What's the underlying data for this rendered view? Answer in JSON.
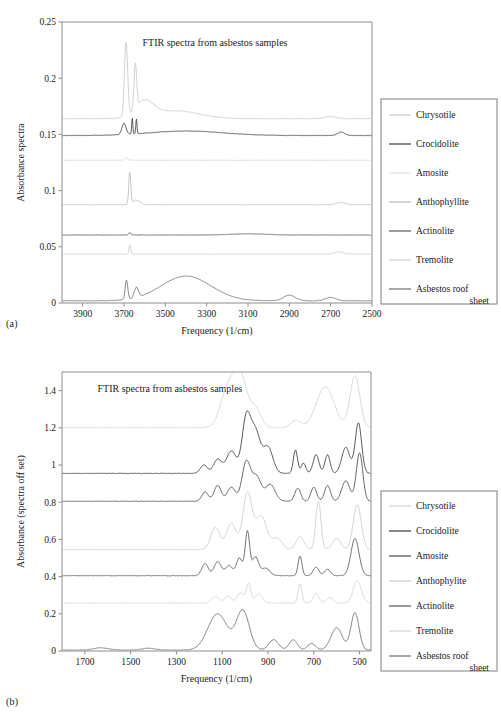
{
  "figure": {
    "panels": [
      {
        "id": "a",
        "label": "(a)",
        "title": "FTIR spectra from asbestos samples"
      },
      {
        "id": "b",
        "label": "(b)",
        "title": "FTIR spectra from asbestos samples"
      }
    ]
  },
  "chart_data": [
    {
      "type": "line",
      "panel": "a",
      "title": "FTIR spectra from asbestos samples",
      "xlabel": "Frequency (1/cm)",
      "ylabel": "Absorbance spectra",
      "xlim": [
        4000,
        2500
      ],
      "ylim": [
        0,
        0.25
      ],
      "xticks": [
        3900,
        3700,
        3500,
        3300,
        3100,
        2900,
        2700,
        2500
      ],
      "yticks": [
        0,
        0.05,
        0.1,
        0.15,
        0.2,
        0.25
      ],
      "x_inverted": true,
      "grid": false,
      "legend_position": "right",
      "series": [
        {
          "name": "Chrysotile",
          "color": "#c9c9c9",
          "baseline": 0.164,
          "peaks": [
            {
              "x": 3690,
              "height": 0.066,
              "width": 11
            },
            {
              "x": 3645,
              "height": 0.04,
              "width": 9
            },
            {
              "x": 3600,
              "height": 0.014,
              "width": 60
            },
            {
              "x": 3450,
              "height": 0.007,
              "width": 160
            },
            {
              "x": 2700,
              "height": 0.002,
              "width": 40
            }
          ]
        },
        {
          "name": "Crocidolite",
          "color": "#3d3d3d",
          "baseline": 0.149,
          "peaks": [
            {
              "x": 3700,
              "height": 0.01,
              "width": 14
            },
            {
              "x": 3660,
              "height": 0.014,
              "width": 4
            },
            {
              "x": 3640,
              "height": 0.013,
              "width": 4
            },
            {
              "x": 3400,
              "height": 0.004,
              "width": 250
            },
            {
              "x": 2650,
              "height": 0.003,
              "width": 25
            }
          ]
        },
        {
          "name": "Amosite",
          "color": "#d8d8d8",
          "baseline": 0.127,
          "peaks": [
            {
              "x": 3690,
              "height": 0.002,
              "width": 12
            }
          ]
        },
        {
          "name": "Anthophyllite",
          "color": "#bdbdbd",
          "baseline": 0.0875,
          "peaks": [
            {
              "x": 3672,
              "height": 0.028,
              "width": 7
            },
            {
              "x": 3640,
              "height": 0.004,
              "width": 25
            },
            {
              "x": 2650,
              "height": 0.002,
              "width": 30
            }
          ]
        },
        {
          "name": "Actinolite",
          "color": "#5a5a5a",
          "baseline": 0.0605,
          "peaks": [
            {
              "x": 3672,
              "height": 0.002,
              "width": 8
            },
            {
              "x": 3100,
              "height": 0.001,
              "width": 120
            }
          ]
        },
        {
          "name": "Tremolite",
          "color": "#cfcfcf",
          "baseline": 0.0435,
          "peaks": [
            {
              "x": 3672,
              "height": 0.008,
              "width": 6
            },
            {
              "x": 2660,
              "height": 0.002,
              "width": 30
            }
          ]
        },
        {
          "name": "Asbestos roof sheet",
          "color": "#707070",
          "baseline": 0.002,
          "peaks": [
            {
              "x": 3688,
              "height": 0.017,
              "width": 9
            },
            {
              "x": 3640,
              "height": 0.009,
              "width": 14
            },
            {
              "x": 3400,
              "height": 0.022,
              "width": 170
            },
            {
              "x": 2900,
              "height": 0.005,
              "width": 40
            },
            {
              "x": 2700,
              "height": 0.003,
              "width": 35
            }
          ]
        }
      ]
    },
    {
      "type": "line",
      "panel": "b",
      "title": "FTIR spectra from asbestos samples",
      "xlabel": "Frequency (1/cm)",
      "ylabel": "Absorbance (spectra off set)",
      "xlim": [
        1800,
        450
      ],
      "ylim": [
        0,
        1.5
      ],
      "xticks": [
        1700,
        1500,
        1300,
        1100,
        900,
        700,
        500
      ],
      "yticks": [
        0,
        0.2,
        0.4,
        0.6,
        0.8,
        1.0,
        1.2,
        1.4
      ],
      "x_inverted": true,
      "grid": false,
      "legend_position": "right",
      "series": [
        {
          "name": "Chrysotile",
          "color": "#d2d2d2",
          "baseline": 1.2,
          "peaks": [
            {
              "x": 1075,
              "height": 0.21,
              "width": 45
            },
            {
              "x": 1020,
              "height": 0.26,
              "width": 40
            },
            {
              "x": 955,
              "height": 0.1,
              "width": 35
            },
            {
              "x": 780,
              "height": 0.04,
              "width": 30
            },
            {
              "x": 650,
              "height": 0.22,
              "width": 55
            },
            {
              "x": 520,
              "height": 0.28,
              "width": 30
            }
          ]
        },
        {
          "name": "Crocidolite",
          "color": "#3a3a3a",
          "baseline": 0.955,
          "peaks": [
            {
              "x": 1180,
              "height": 0.045,
              "width": 22
            },
            {
              "x": 1120,
              "height": 0.075,
              "width": 25
            },
            {
              "x": 1060,
              "height": 0.12,
              "width": 30
            },
            {
              "x": 995,
              "height": 0.29,
              "width": 26
            },
            {
              "x": 955,
              "height": 0.22,
              "width": 30
            },
            {
              "x": 900,
              "height": 0.14,
              "width": 30
            },
            {
              "x": 780,
              "height": 0.125,
              "width": 13
            },
            {
              "x": 745,
              "height": 0.055,
              "width": 14
            },
            {
              "x": 690,
              "height": 0.1,
              "width": 18
            },
            {
              "x": 640,
              "height": 0.1,
              "width": 16
            },
            {
              "x": 560,
              "height": 0.14,
              "width": 25
            },
            {
              "x": 505,
              "height": 0.27,
              "width": 20
            }
          ]
        },
        {
          "name": "Amosite",
          "color": "#4a4a4a",
          "baseline": 0.805,
          "peaks": [
            {
              "x": 1175,
              "height": 0.05,
              "width": 20
            },
            {
              "x": 1120,
              "height": 0.085,
              "width": 22
            },
            {
              "x": 1060,
              "height": 0.075,
              "width": 25
            },
            {
              "x": 995,
              "height": 0.21,
              "width": 26
            },
            {
              "x": 950,
              "height": 0.13,
              "width": 28
            },
            {
              "x": 890,
              "height": 0.09,
              "width": 30
            },
            {
              "x": 770,
              "height": 0.07,
              "width": 18
            },
            {
              "x": 700,
              "height": 0.075,
              "width": 18
            },
            {
              "x": 640,
              "height": 0.085,
              "width": 18
            },
            {
              "x": 560,
              "height": 0.11,
              "width": 25
            },
            {
              "x": 500,
              "height": 0.26,
              "width": 20
            }
          ]
        },
        {
          "name": "Anthophylite",
          "color": "#cccccc",
          "baseline": 0.545,
          "peaks": [
            {
              "x": 1130,
              "height": 0.12,
              "width": 28
            },
            {
              "x": 1060,
              "height": 0.14,
              "width": 30
            },
            {
              "x": 990,
              "height": 0.3,
              "width": 28
            },
            {
              "x": 930,
              "height": 0.18,
              "width": 35
            },
            {
              "x": 860,
              "height": 0.06,
              "width": 30
            },
            {
              "x": 760,
              "height": 0.07,
              "width": 25
            },
            {
              "x": 680,
              "height": 0.26,
              "width": 16
            },
            {
              "x": 600,
              "height": 0.06,
              "width": 25
            },
            {
              "x": 510,
              "height": 0.24,
              "width": 25
            }
          ]
        },
        {
          "name": "Actinolite",
          "color": "#585858",
          "baseline": 0.405,
          "peaks": [
            {
              "x": 1175,
              "height": 0.065,
              "width": 20
            },
            {
              "x": 1120,
              "height": 0.075,
              "width": 22
            },
            {
              "x": 1070,
              "height": 0.055,
              "width": 22
            },
            {
              "x": 1025,
              "height": 0.095,
              "width": 18
            },
            {
              "x": 990,
              "height": 0.235,
              "width": 14
            },
            {
              "x": 955,
              "height": 0.1,
              "width": 20
            },
            {
              "x": 910,
              "height": 0.04,
              "width": 25
            },
            {
              "x": 760,
              "height": 0.105,
              "width": 12
            },
            {
              "x": 690,
              "height": 0.045,
              "width": 18
            },
            {
              "x": 640,
              "height": 0.035,
              "width": 18
            },
            {
              "x": 520,
              "height": 0.2,
              "width": 25
            }
          ]
        },
        {
          "name": "Tremolite",
          "color": "#d5d5d5",
          "baseline": 0.258,
          "peaks": [
            {
              "x": 1130,
              "height": 0.035,
              "width": 22
            },
            {
              "x": 1075,
              "height": 0.035,
              "width": 22
            },
            {
              "x": 1020,
              "height": 0.055,
              "width": 20
            },
            {
              "x": 985,
              "height": 0.105,
              "width": 14
            },
            {
              "x": 940,
              "height": 0.05,
              "width": 22
            },
            {
              "x": 760,
              "height": 0.1,
              "width": 12
            },
            {
              "x": 690,
              "height": 0.05,
              "width": 18
            },
            {
              "x": 630,
              "height": 0.03,
              "width": 20
            },
            {
              "x": 510,
              "height": 0.12,
              "width": 25
            }
          ]
        },
        {
          "name": "Asbestos roof sheet",
          "color": "#6e6e6e",
          "baseline": 0.005,
          "peaks": [
            {
              "x": 1630,
              "height": 0.012,
              "width": 45
            },
            {
              "x": 1420,
              "height": 0.01,
              "width": 40
            },
            {
              "x": 1120,
              "height": 0.195,
              "width": 60
            },
            {
              "x": 1010,
              "height": 0.21,
              "width": 40
            },
            {
              "x": 875,
              "height": 0.055,
              "width": 30
            },
            {
              "x": 790,
              "height": 0.055,
              "width": 25
            },
            {
              "x": 710,
              "height": 0.035,
              "width": 25
            },
            {
              "x": 600,
              "height": 0.12,
              "width": 35
            },
            {
              "x": 520,
              "height": 0.2,
              "width": 25
            }
          ]
        }
      ]
    }
  ],
  "legends": [
    {
      "panel": "a",
      "entries": [
        {
          "label": "Chrysotile",
          "color": "#c9c9c9"
        },
        {
          "label": "Crocidolite",
          "color": "#3d3d3d"
        },
        {
          "label": "Amosite",
          "color": "#e2e2e2"
        },
        {
          "label": "Anthophyllite",
          "color": "#bdbdbd"
        },
        {
          "label": "Actinolite",
          "color": "#5a5a5a"
        },
        {
          "label": "Tremolite",
          "color": "#cfcfcf"
        },
        {
          "label": "Asbestos roof",
          "label2": "sheet",
          "color": "#707070"
        }
      ]
    },
    {
      "panel": "b",
      "entries": [
        {
          "label": "Chrysotile",
          "color": "#d2d2d2"
        },
        {
          "label": "Crocidolite",
          "color": "#3a3a3a"
        },
        {
          "label": "Amosite",
          "color": "#4a4a4a"
        },
        {
          "label": "Anthophylite",
          "color": "#cccccc"
        },
        {
          "label": "Actinolite",
          "color": "#585858"
        },
        {
          "label": "Tremolite",
          "color": "#d5d5d5"
        },
        {
          "label": "Asbestos roof",
          "label2": "sheet",
          "color": "#6e6e6e"
        }
      ]
    }
  ]
}
